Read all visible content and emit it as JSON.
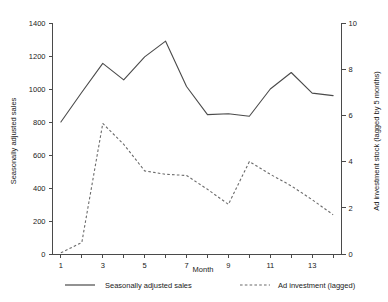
{
  "chart_data": {
    "type": "line",
    "title": "",
    "xlabel": "Month",
    "ylabel": "Seasonally adjusted sales",
    "y2label": "Ad investment stock (lagged by 5 months)",
    "grid": false,
    "legend_position": "bottom",
    "x": [
      1,
      2,
      3,
      4,
      5,
      6,
      7,
      8,
      9,
      10,
      11,
      12,
      13,
      14
    ],
    "xlim": [
      0.6,
      14.4
    ],
    "xticks_major": [
      1,
      3,
      5,
      7,
      9,
      11,
      13
    ],
    "xticks_all": [
      1,
      2,
      3,
      4,
      5,
      6,
      7,
      8,
      9,
      10,
      11,
      12,
      13,
      14
    ],
    "xtick_labels": [
      "1",
      "3",
      "5",
      "7",
      "9",
      "11",
      "13"
    ],
    "ylim": [
      0,
      1400
    ],
    "yticks": [
      0,
      200,
      400,
      600,
      800,
      1000,
      1200,
      1400
    ],
    "ytick_labels": [
      "0",
      "200",
      "400",
      "600",
      "800",
      "1000",
      "1200",
      "1400"
    ],
    "y2lim": [
      0,
      10
    ],
    "y2ticks": [
      0,
      2,
      4,
      6,
      8,
      10
    ],
    "y2tick_labels": [
      "0",
      "2",
      "4",
      "6",
      "8",
      "10"
    ],
    "series": [
      {
        "name": "Seasonally adjusted sales",
        "axis": "left",
        "style": "solid",
        "color": "#4a4a4a",
        "values": [
          800,
          980,
          1155,
          1055,
          1195,
          1290,
          1015,
          845,
          850,
          835,
          1000,
          1100,
          975,
          960
        ]
      },
      {
        "name": "Ad investment (lagged)",
        "axis": "right",
        "style": "dashed",
        "color": "#6b6b6b",
        "values": [
          0.05,
          0.5,
          5.65,
          4.75,
          3.6,
          3.45,
          3.4,
          2.8,
          2.15,
          4.0,
          3.45,
          2.95,
          2.35,
          1.7
        ]
      }
    ],
    "legend": [
      {
        "label": "Seasonally adjusted sales",
        "style": "solid"
      },
      {
        "label": "Ad investment (lagged)",
        "style": "dashed"
      }
    ]
  }
}
